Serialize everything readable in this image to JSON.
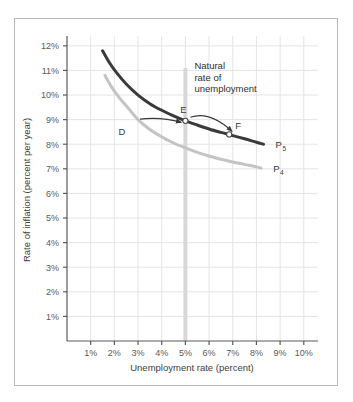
{
  "figure": {
    "background_color": "#ffffff",
    "frame_color": "#b9b9b9"
  },
  "chart_data": {
    "type": "line",
    "title": "",
    "xlabel": "Unemployment rate (percent)",
    "ylabel": "Rate of inflation (percent per year)",
    "xlim": [
      0,
      10.6
    ],
    "ylim": [
      0,
      12.4
    ],
    "xticks": [
      1,
      2,
      3,
      4,
      5,
      6,
      7,
      8,
      9,
      10
    ],
    "xticklabels": [
      "1%",
      "2%",
      "3%",
      "4%",
      "5%",
      "6%",
      "7%",
      "8%",
      "9%",
      "10%"
    ],
    "yticks": [
      1,
      2,
      3,
      4,
      5,
      6,
      7,
      8,
      9,
      10,
      11,
      12
    ],
    "yticklabels": [
      "1%",
      "2%",
      "3%",
      "4%",
      "5%",
      "6%",
      "7%",
      "8%",
      "9%",
      "10%",
      "11%",
      "12%"
    ],
    "grid": true,
    "grid_color": "#e4e4e4",
    "legend_position": "inline-curve-labels",
    "series": [
      {
        "name": "P5",
        "label": "P",
        "label_sub": "5",
        "color": "#3a3a3a",
        "linewidth": 3.0,
        "x": [
          1.5,
          1.8,
          2.1,
          2.5,
          3.0,
          3.5,
          4.0,
          4.5,
          5.0,
          5.5,
          6.0,
          6.5,
          7.0,
          7.5,
          8.0,
          8.3
        ],
        "y": [
          11.8,
          11.3,
          10.9,
          10.45,
          10.0,
          9.65,
          9.38,
          9.15,
          8.95,
          8.78,
          8.62,
          8.48,
          8.35,
          8.22,
          8.08,
          8.0
        ]
      },
      {
        "name": "P4",
        "label": "P",
        "label_sub": "4",
        "color": "#c4c4c4",
        "linewidth": 3.0,
        "x": [
          1.6,
          1.9,
          2.2,
          2.6,
          3.0,
          3.5,
          4.0,
          4.5,
          5.0,
          5.5,
          6.0,
          6.5,
          7.0,
          7.5,
          8.0,
          8.2
        ],
        "y": [
          10.8,
          10.3,
          9.9,
          9.45,
          9.0,
          8.6,
          8.3,
          8.05,
          7.85,
          7.67,
          7.52,
          7.39,
          7.28,
          7.18,
          7.08,
          7.03
        ]
      }
    ],
    "points": [
      {
        "id": "D",
        "label": "D",
        "x": 3.0,
        "y": 9.0,
        "label_dx": -16,
        "label_dy": 15,
        "on_series": "P4",
        "marker": "open-circle"
      },
      {
        "id": "E",
        "label": "E",
        "x": 5.0,
        "y": 8.95,
        "label_dx": -2,
        "label_dy": -8,
        "on_series": "P5",
        "marker": "open-circle"
      },
      {
        "id": "F",
        "label": "F",
        "x": 6.85,
        "y": 8.4,
        "label_dx": 9,
        "label_dy": -5,
        "on_series": "P5",
        "marker": "open-circle"
      }
    ],
    "vertical_marker": {
      "label": "Natural rate of unemployment",
      "label_lines": [
        "Natural",
        "rate of",
        "unemployment"
      ],
      "x": 5.0,
      "color": "#d8d8d8",
      "width_px": 4,
      "y_top": 11.1,
      "y_bottom": 0
    },
    "annotations": [
      {
        "id": "arrow-d-to-e",
        "from": "D",
        "to": "E",
        "style": "curved-arrow",
        "color": "#3a3a3a"
      },
      {
        "id": "arrow-e-to-f",
        "from": "E",
        "to": "F",
        "style": "curved-arrow",
        "color": "#3a3a3a"
      }
    ]
  }
}
